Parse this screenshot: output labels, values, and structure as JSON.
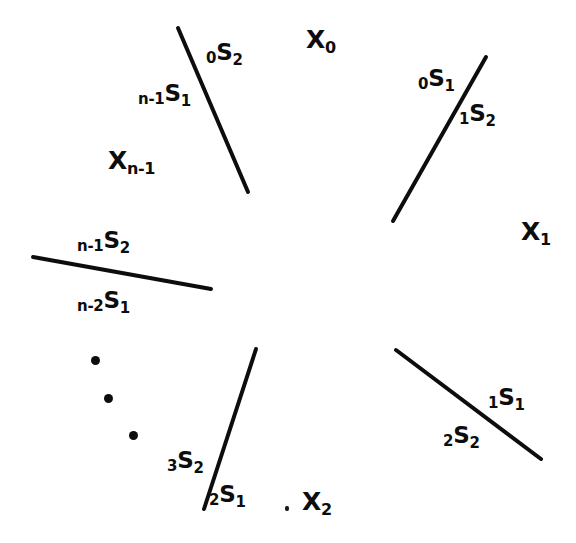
{
  "figure": {
    "background_color": "#ffffff",
    "ink_color": "#0d0d0d",
    "width": 576,
    "height": 543
  },
  "regions": [
    {
      "name": "region-x0",
      "base": "X",
      "sub": "0",
      "x": 306,
      "y": 27
    },
    {
      "name": "region-x1",
      "base": "X",
      "sub": "1",
      "x": 521,
      "y": 219
    },
    {
      "name": "region-x2",
      "base": "X",
      "sub": "2",
      "x": 302,
      "y": 489
    },
    {
      "name": "region-xn-1",
      "base": "X",
      "sub": "n-1",
      "x": 108,
      "y": 148
    }
  ],
  "boundary_labels": [
    {
      "name": "label-0s2",
      "pre": "0",
      "base": "S",
      "post": "2",
      "x": 206,
      "y": 41
    },
    {
      "name": "label-n-1s1",
      "pre": "n-1",
      "base": "S",
      "post": "1",
      "x": 138,
      "y": 82
    },
    {
      "name": "label-0s1",
      "pre": "0",
      "base": "S",
      "post": "1",
      "x": 418,
      "y": 67
    },
    {
      "name": "label-1s2",
      "pre": "1",
      "base": "S",
      "post": "2",
      "x": 459,
      "y": 102
    },
    {
      "name": "label-n-1s2",
      "pre": "n-1",
      "base": "S",
      "post": "2",
      "x": 77,
      "y": 229
    },
    {
      "name": "label-n-2s1",
      "pre": "n-2",
      "base": "S",
      "post": "1",
      "x": 77,
      "y": 289
    },
    {
      "name": "label-3s2",
      "pre": "3",
      "base": "S",
      "post": "2",
      "x": 167,
      "y": 449
    },
    {
      "name": "label-2s1",
      "pre": "2",
      "base": "S",
      "post": "1",
      "x": 209,
      "y": 483
    },
    {
      "name": "label-1s1",
      "pre": "1",
      "base": "S",
      "post": "1",
      "x": 488,
      "y": 386
    },
    {
      "name": "label-2s2",
      "pre": "2",
      "base": "S",
      "post": "2",
      "x": 443,
      "y": 424
    }
  ],
  "strokes": [
    {
      "name": "boundary-stroke-top-left",
      "x1": 178,
      "y1": 28,
      "x2": 248,
      "y2": 192,
      "width": 4.0
    },
    {
      "name": "boundary-stroke-top-right",
      "x1": 393,
      "y1": 221,
      "x2": 486,
      "y2": 57,
      "width": 4.0
    },
    {
      "name": "boundary-stroke-left",
      "x1": 33,
      "y1": 257,
      "x2": 211,
      "y2": 289,
      "width": 4.0
    },
    {
      "name": "boundary-stroke-bottom-left",
      "x1": 256,
      "y1": 349,
      "x2": 204,
      "y2": 509,
      "width": 4.0
    },
    {
      "name": "boundary-stroke-bottom-right",
      "x1": 396,
      "y1": 350,
      "x2": 541,
      "y2": 459,
      "width": 4.0
    }
  ],
  "ellipsis_dots": [
    {
      "name": "ellipsis-dot-1",
      "x": 91,
      "y": 356,
      "d": 9
    },
    {
      "name": "ellipsis-dot-2",
      "x": 104,
      "y": 394,
      "d": 9
    },
    {
      "name": "ellipsis-dot-3",
      "x": 129,
      "y": 431,
      "d": 9
    }
  ],
  "stray_marks": [
    {
      "name": "stray-comma-mark",
      "x": 285,
      "y": 506
    }
  ]
}
